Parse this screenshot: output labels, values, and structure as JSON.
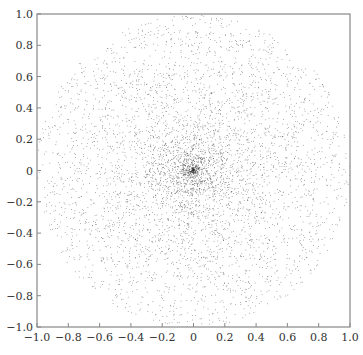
{
  "chart_data": {
    "type": "scatter",
    "title": "",
    "xlabel": "",
    "ylabel": "",
    "xlim": [
      -1.0,
      1.0
    ],
    "ylim": [
      -1.0,
      1.0
    ],
    "grid": false,
    "legend": null,
    "x_ticks": [
      -1.0,
      -0.8,
      -0.6,
      -0.4,
      -0.2,
      0,
      0.2,
      0.4,
      0.6,
      0.8,
      1.0
    ],
    "x_tick_labels": [
      "−1.0",
      "−0.8",
      "−0.6",
      "−0.4",
      "−0.2",
      "0",
      "0.2",
      "0.4",
      "0.6",
      "0.8",
      "1.0"
    ],
    "y_ticks": [
      1.0,
      0.8,
      0.6,
      0.4,
      0.2,
      0,
      -0.2,
      -0.4,
      -0.6,
      -0.8,
      -1.0
    ],
    "y_tick_labels": [
      "1.0",
      "0.8",
      "0.6",
      "0.4",
      "0.2",
      "0",
      "−0.2",
      "−0.4",
      "−0.6",
      "−0.8",
      "−1.0"
    ],
    "series": [
      {
        "name": "points",
        "description": "Points sampled in the unit disk with radius drawn uniformly (not area-uniform), producing a dense cluster at the origin",
        "count": 5000,
        "disk_radius": 1.0,
        "center": [
          0,
          0
        ],
        "color": "#333333",
        "marker_size": 0.7
      }
    ]
  },
  "colors": {
    "axis": "#888888",
    "text": "#333333",
    "background": "#ffffff"
  }
}
